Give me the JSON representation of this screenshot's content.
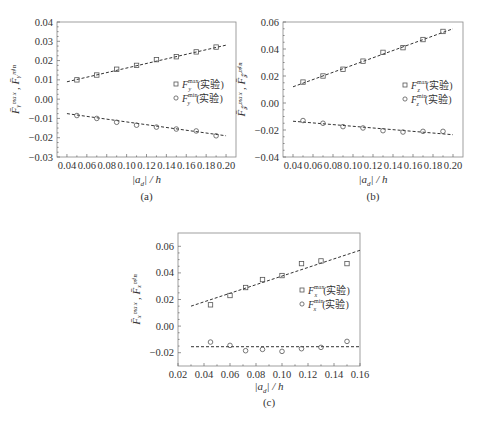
{
  "chart_data": [
    {
      "id": "a",
      "type": "scatter",
      "caption": "(a)",
      "xlabel": "|a_d| / h",
      "ylabel": "F̄_y^max , F̄_y^min",
      "xlim": [
        0.03,
        0.21
      ],
      "ylim": [
        -0.03,
        0.04
      ],
      "xticks": [
        0.04,
        0.06,
        0.08,
        0.1,
        0.12,
        0.14,
        0.16,
        0.18,
        0.2
      ],
      "xtick_labels": [
        "0.04",
        "0.06",
        "0.08",
        "0.10",
        "0.12",
        "0.14",
        "0.16",
        "0.18",
        "0.20"
      ],
      "yticks": [
        -0.03,
        -0.02,
        -0.01,
        0.0,
        0.01,
        0.02,
        0.03,
        0.04
      ],
      "ytick_labels": [
        "−0.03",
        "−0.02",
        "−0.01",
        "0.00",
        "0.01",
        "0.02",
        "0.03",
        "0.04"
      ],
      "legend_position": "right-middle",
      "series": [
        {
          "name": "F_y^max (实验)",
          "marker": "square",
          "x": [
            0.05,
            0.07,
            0.09,
            0.11,
            0.13,
            0.15,
            0.17,
            0.19
          ],
          "values": [
            0.01,
            0.0125,
            0.0155,
            0.0175,
            0.0205,
            0.022,
            0.0245,
            0.027
          ],
          "fit": {
            "x": [
              0.04,
              0.2
            ],
            "y": [
              0.009,
              0.028
            ]
          }
        },
        {
          "name": "F_y^min (实验)",
          "marker": "circle",
          "x": [
            0.05,
            0.07,
            0.09,
            0.11,
            0.13,
            0.15,
            0.17,
            0.19
          ],
          "values": [
            -0.0085,
            -0.01,
            -0.012,
            -0.0135,
            -0.0145,
            -0.0155,
            -0.0165,
            -0.019
          ],
          "fit": {
            "x": [
              0.04,
              0.2
            ],
            "y": [
              -0.0075,
              -0.019
            ]
          }
        }
      ]
    },
    {
      "id": "b",
      "type": "scatter",
      "caption": "(b)",
      "xlabel": "|a_d| / h",
      "ylabel": "F̄_z^max , F̄_z^min",
      "xlim": [
        0.03,
        0.21
      ],
      "ylim": [
        -0.04,
        0.06
      ],
      "xticks": [
        0.04,
        0.06,
        0.08,
        0.1,
        0.12,
        0.14,
        0.16,
        0.18,
        0.2
      ],
      "xtick_labels": [
        "0.04",
        "0.06",
        "0.08",
        "0.10",
        "0.12",
        "0.14",
        "0.16",
        "0.18",
        "0.20"
      ],
      "yticks": [
        -0.04,
        -0.02,
        0.0,
        0.02,
        0.04,
        0.06
      ],
      "ytick_labels": [
        "−0.04",
        "−0.02",
        "0.00",
        "0.02",
        "0.04",
        "0.06"
      ],
      "legend_position": "right-middle",
      "series": [
        {
          "name": "F_z^max (实验)",
          "marker": "square",
          "x": [
            0.05,
            0.07,
            0.09,
            0.11,
            0.13,
            0.15,
            0.17,
            0.19
          ],
          "values": [
            0.0155,
            0.02,
            0.025,
            0.031,
            0.0375,
            0.041,
            0.047,
            0.053
          ],
          "fit": {
            "x": [
              0.04,
              0.2
            ],
            "y": [
              0.012,
              0.055
            ]
          }
        },
        {
          "name": "F_z^min (实验)",
          "marker": "circle",
          "x": [
            0.05,
            0.07,
            0.09,
            0.11,
            0.13,
            0.15,
            0.17,
            0.19
          ],
          "values": [
            -0.013,
            -0.015,
            -0.0175,
            -0.0185,
            -0.0205,
            -0.0215,
            -0.021,
            -0.021
          ],
          "fit": {
            "x": [
              0.04,
              0.2
            ],
            "y": [
              -0.0135,
              -0.0235
            ]
          }
        }
      ]
    },
    {
      "id": "c",
      "type": "scatter",
      "caption": "(c)",
      "xlabel": "|a_d| / h",
      "ylabel": "F̄_x^max , F̄_x^min",
      "xlim": [
        0.02,
        0.16
      ],
      "ylim": [
        -0.03,
        0.07
      ],
      "xticks": [
        0.02,
        0.04,
        0.06,
        0.08,
        0.1,
        0.12,
        0.14,
        0.16
      ],
      "xtick_labels": [
        "0.02",
        "0.04",
        "0.06",
        "0.08",
        "0.10",
        "0.12",
        "0.14",
        "0.16"
      ],
      "yticks": [
        -0.02,
        0.0,
        0.02,
        0.04,
        0.06
      ],
      "ytick_labels": [
        "−0.02",
        "0.00",
        "0.02",
        "0.04",
        "0.06"
      ],
      "legend_position": "right-middle",
      "series": [
        {
          "name": "F_x^max (实验)",
          "marker": "square",
          "x": [
            0.045,
            0.06,
            0.072,
            0.085,
            0.1,
            0.115,
            0.13,
            0.15
          ],
          "values": [
            0.016,
            0.023,
            0.029,
            0.035,
            0.038,
            0.047,
            0.049,
            0.047
          ],
          "fit": {
            "x": [
              0.03,
              0.16
            ],
            "y": [
              0.015,
              0.057
            ]
          }
        },
        {
          "name": "F_x^min (实验)",
          "marker": "circle",
          "x": [
            0.045,
            0.06,
            0.072,
            0.085,
            0.1,
            0.115,
            0.13,
            0.15
          ],
          "values": [
            -0.012,
            -0.0145,
            -0.0185,
            -0.0175,
            -0.019,
            -0.017,
            -0.016,
            -0.0115
          ],
          "fit": {
            "x": [
              0.03,
              0.16
            ],
            "y": [
              -0.0155,
              -0.0155
            ]
          }
        }
      ]
    }
  ],
  "panels": {
    "a": {
      "caption": "(a)",
      "legend": [
        {
          "sym": "F",
          "sup": "max",
          "sub": "y",
          "suffix": "(实验)"
        },
        {
          "sym": "F",
          "sup": "min",
          "sub": "y",
          "suffix": "(实验)"
        }
      ],
      "xlabel_main": "|a",
      "xlabel_sub": "d",
      "xlabel_tail": "| / h",
      "ylabel": "F̄ᵧᵐᵃˣ , F̄ᵧᵐⁱⁿ"
    },
    "b": {
      "caption": "(b)",
      "legend": [
        {
          "sym": "F",
          "sup": "max",
          "sub": "z",
          "suffix": "(实验)"
        },
        {
          "sym": "F",
          "sup": "min",
          "sub": "z",
          "suffix": "(实验)"
        }
      ],
      "xlabel_main": "|a",
      "xlabel_sub": "d",
      "xlabel_tail": "| / h",
      "ylabel": "F̄𝓏ᵐᵃˣ , F̄𝓏ᵐⁱⁿ"
    },
    "c": {
      "caption": "(c)",
      "legend": [
        {
          "sym": "F",
          "sup": "max",
          "sub": "x",
          "suffix": "(实验)"
        },
        {
          "sym": "F",
          "sup": "min",
          "sub": "x",
          "suffix": "(实验)"
        }
      ],
      "xlabel_main": "|a",
      "xlabel_sub": "d",
      "xlabel_tail": "| / h",
      "ylabel": "F̄ₓᵐᵃˣ , F̄ₓᵐⁱⁿ"
    }
  }
}
